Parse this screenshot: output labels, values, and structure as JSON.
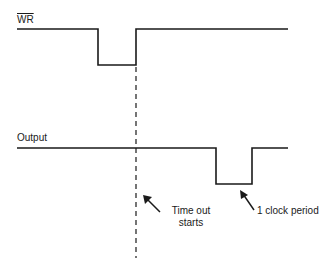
{
  "signals": [
    {
      "name": "WR",
      "overline": true
    },
    {
      "name": "Output",
      "overline": false
    }
  ],
  "annotations": {
    "timeout": {
      "line1": "Time out",
      "line2": "starts"
    },
    "clock": "1 clock period"
  },
  "colors": {
    "stroke": "#1a1a1a",
    "background": "#ffffff"
  }
}
